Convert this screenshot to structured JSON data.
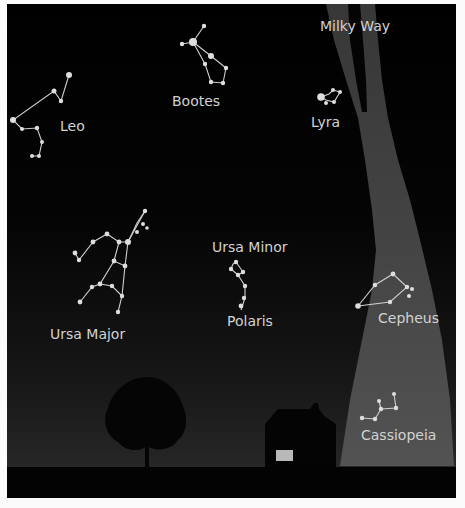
{
  "colors": {
    "sky_top": "#000000",
    "sky_bottom": "#2a2a2a",
    "milky_way": "#4a4a4a",
    "ground": "#030303",
    "silhouette": "#050505",
    "window": "#b9b9b9",
    "star": "#dedede",
    "label": "#d2d2d2",
    "page_background": "#fbfbfb"
  },
  "milky_way": {
    "label": "Milky Way"
  },
  "constellations": [
    {
      "id": "leo",
      "label": "Leo"
    },
    {
      "id": "bootes",
      "label": "Bootes"
    },
    {
      "id": "lyra",
      "label": "Lyra"
    },
    {
      "id": "ursa-major",
      "label": "Ursa Major"
    },
    {
      "id": "ursa-minor",
      "label": "Ursa Minor"
    },
    {
      "id": "polaris",
      "label": "Polaris"
    },
    {
      "id": "cepheus",
      "label": "Cepheus"
    },
    {
      "id": "cassiopeia",
      "label": "Cassiopeia"
    }
  ],
  "scenery": {
    "tree": "tree-silhouette",
    "house": "house-silhouette",
    "ground": "ground-strip"
  }
}
